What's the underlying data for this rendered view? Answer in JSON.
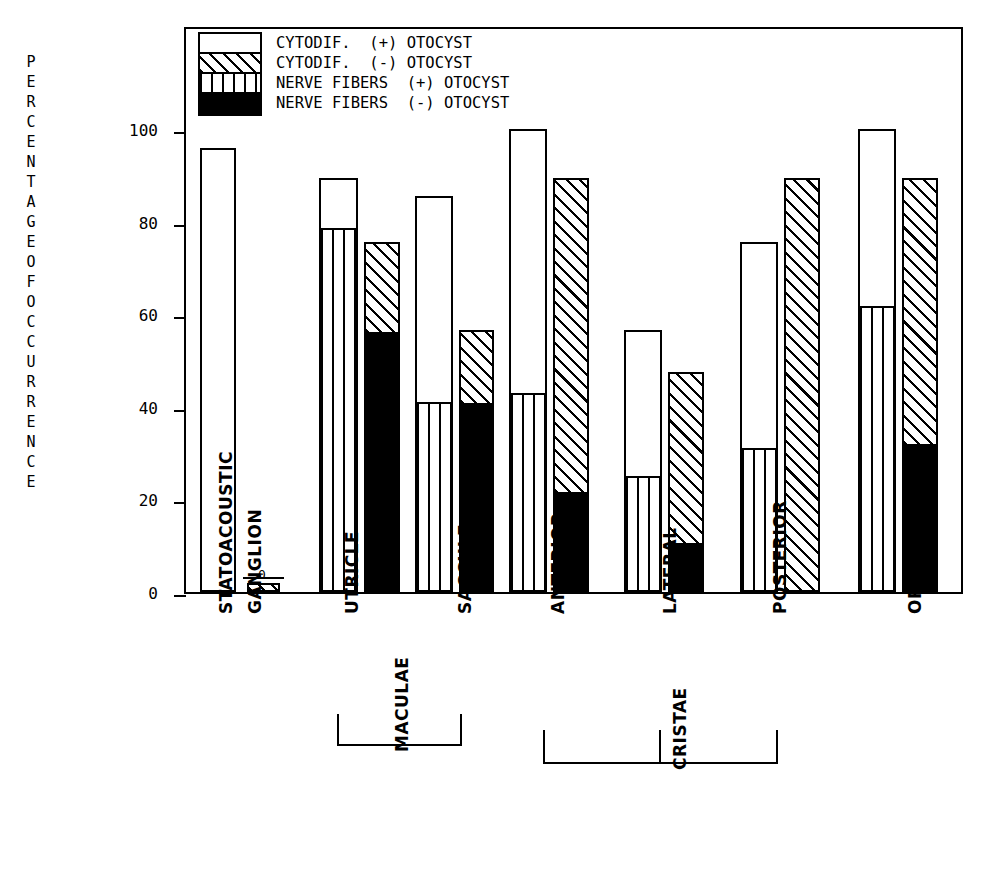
{
  "chart_data": {
    "type": "bar",
    "title": "",
    "subtitle": "",
    "xlabel": "",
    "ylabel": "PERCENTAGE OF OCCURRENCE",
    "ylim": [
      0,
      105
    ],
    "yticks": [
      0,
      20,
      40,
      60,
      80,
      100
    ],
    "ytick_labels": [
      "0",
      "20",
      "40",
      "60",
      "80",
      "100"
    ],
    "grid": false,
    "legend_position": "inside top-left",
    "legend": [
      {
        "key": "cytodif_plus",
        "pattern": "blank",
        "label": "CYTODIF.  (+) OTOCYST"
      },
      {
        "key": "cytodif_minus",
        "pattern": "diag",
        "label": "CYTODIF.  (-) OTOCYST"
      },
      {
        "key": "nerve_plus",
        "pattern": "vert",
        "label": "NERVE FIBERS  (+) OTOCYST"
      },
      {
        "key": "nerve_minus",
        "pattern": "solid",
        "label": "NERVE FIBERS  (-) OTOCYST"
      }
    ],
    "categories": [
      "STATOACOUSTIC GANGLION",
      "UTRICLE",
      "SACCULE",
      "ANTERIOR",
      "LATERAL",
      "POSTERIOR",
      "ORGAN OF CORTI"
    ],
    "series": [
      {
        "name": "CYTODIF. (+) OTOCYST",
        "pattern": "blank",
        "values": [
          96.0,
          89.5,
          85.5,
          100.0,
          56.5,
          75.5,
          100.0
        ]
      },
      {
        "name": "NERVE FIBERS (+) OTOCYST",
        "pattern": "vert",
        "values": [
          0.0,
          78.5,
          40.5,
          42.5,
          24.5,
          30.5,
          61.5
        ]
      },
      {
        "name": "CYTODIF. (-) OTOCYST",
        "pattern": "diag",
        "values": [
          2.0,
          75.5,
          56.5,
          89.5,
          47.5,
          89.5,
          89.5
        ]
      },
      {
        "name": "NERVE FIBERS (-) OTOCYST",
        "pattern": "solid",
        "values": [
          0.0,
          56.0,
          40.5,
          21.0,
          10.0,
          0.0,
          31.5
        ]
      }
    ],
    "annotations": [
      {
        "text": "0",
        "near": "STATOACOUSTIC GANGLION (-) otocyst top"
      }
    ],
    "groups": [
      {
        "label": "MACULAE",
        "members": [
          "UTRICLE",
          "SACCULE"
        ]
      },
      {
        "label": "CRISTAE",
        "members": [
          "ANTERIOR",
          "LATERAL",
          "POSTERIOR"
        ]
      }
    ]
  },
  "axis": {
    "y_title_chars": [
      "P",
      "E",
      "R",
      "C",
      "E",
      "N",
      "T",
      "A",
      "G",
      "E",
      "",
      "O",
      "F",
      "",
      "O",
      "C",
      "C",
      "U",
      "R",
      "R",
      "E",
      "N",
      "C",
      "E"
    ]
  },
  "xlabels": {
    "statoacoustic_line1": "STATOACOUSTIC",
    "statoacoustic_line2": "GANGLION",
    "utricle": "UTRICLE",
    "saccule": "SACCULE",
    "anterior": "ANTERIOR",
    "lateral": "LATERAL",
    "posterior": "POSTERIOR",
    "organ_of_corti": "ORGAN OF CORTI",
    "maculae": "MACULAE",
    "cristae": "CRISTAE"
  },
  "marks": {
    "ganglion_zero": "0"
  }
}
